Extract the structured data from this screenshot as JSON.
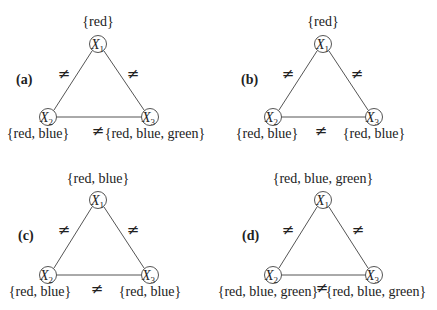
{
  "panels": [
    {
      "label": "(a)",
      "nodes": [
        {
          "name": "X",
          "sub": "1",
          "domain": "{red}"
        },
        {
          "name": "X",
          "sub": "2",
          "domain": "{red, blue}"
        },
        {
          "name": "X",
          "sub": "3",
          "domain": "{red, blue, green}"
        }
      ],
      "edges": [
        "≠",
        "≠",
        "≠"
      ]
    },
    {
      "label": "(b)",
      "nodes": [
        {
          "name": "X",
          "sub": "1",
          "domain": "{red}"
        },
        {
          "name": "X",
          "sub": "2",
          "domain": "{red, blue}"
        },
        {
          "name": "X",
          "sub": "3",
          "domain": "{red, blue}"
        }
      ],
      "edges": [
        "≠",
        "≠",
        "≠"
      ]
    },
    {
      "label": "(c)",
      "nodes": [
        {
          "name": "X",
          "sub": "1",
          "domain": "{red, blue}"
        },
        {
          "name": "X",
          "sub": "2",
          "domain": "{red, blue}"
        },
        {
          "name": "X",
          "sub": "3",
          "domain": "{red, blue}"
        }
      ],
      "edges": [
        "≠",
        "≠",
        "≠"
      ]
    },
    {
      "label": "(d)",
      "nodes": [
        {
          "name": "X",
          "sub": "1",
          "domain": "{red, blue, green}"
        },
        {
          "name": "X",
          "sub": "2",
          "domain": "{red, blue, green}"
        },
        {
          "name": "X",
          "sub": "3",
          "domain": "{red, blue, green}"
        }
      ],
      "edges": [
        "≠",
        "≠",
        "≠"
      ]
    }
  ]
}
